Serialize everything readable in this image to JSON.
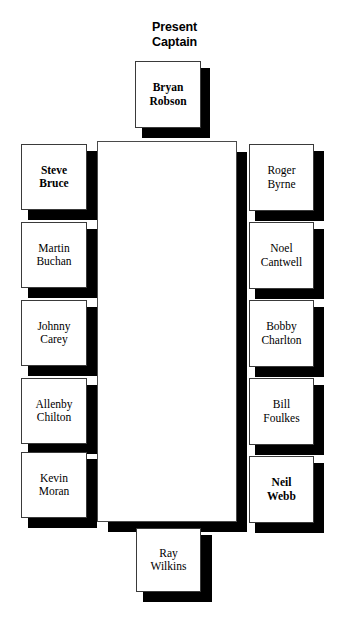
{
  "diagram": {
    "title_text": "Present\nCaptain",
    "colors": {
      "box_fill": "#ffffff",
      "box_border": "#3a3a3a",
      "shadow": "#000000",
      "text": "#000000",
      "background": "#ffffff"
    },
    "captain": {
      "name": "Bryan\nRobson",
      "emphasis": "bold"
    },
    "left_column": [
      {
        "name": "Steve\nBruce",
        "emphasis": "bold"
      },
      {
        "name": "Martin\nBuchan",
        "emphasis": "normal"
      },
      {
        "name": "Johnny\nCarey",
        "emphasis": "normal"
      },
      {
        "name": "Allenby\nChilton",
        "emphasis": "normal"
      },
      {
        "name": "Kevin\nMoran",
        "emphasis": "normal"
      }
    ],
    "right_column": [
      {
        "name": "Roger\nByrne",
        "emphasis": "normal"
      },
      {
        "name": "Noel\nCantwell",
        "emphasis": "normal"
      },
      {
        "name": "Bobby\nCharlton",
        "emphasis": "normal"
      },
      {
        "name": "Bill\nFoulkes",
        "emphasis": "normal"
      },
      {
        "name": "Neil\nWebb",
        "emphasis": "bold"
      }
    ],
    "bottom": {
      "name": "Ray\nWilkins",
      "emphasis": "normal"
    }
  }
}
